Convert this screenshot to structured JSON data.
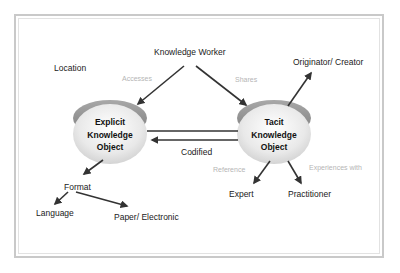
{
  "diagram": {
    "type": "concept-map",
    "nodes": {
      "knowledge_worker": "Knowledge Worker",
      "location": "Location",
      "explicit_object": [
        "Explicit",
        "Knowledge",
        "Object"
      ],
      "tacit_object": [
        "Tacit",
        "Knowledge",
        "Object"
      ],
      "originator": "Originator/ Creator",
      "format": "Format",
      "language": "Language",
      "paper_electronic": "Paper/ Electronic",
      "expert": "Expert",
      "practitioner": "Practitioner"
    },
    "relations": {
      "accesses": "Accesses",
      "shares": "Shares",
      "codified": "Codified",
      "reference": "Reference",
      "experiences_with": "Experiences with"
    },
    "edges": [
      {
        "from": "Knowledge Worker",
        "to": "Explicit Knowledge Object",
        "label": "Accesses"
      },
      {
        "from": "Knowledge Worker",
        "to": "Tacit Knowledge Object",
        "label": "Shares"
      },
      {
        "from": "Tacit Knowledge Object",
        "to": "Originator/ Creator",
        "label": ""
      },
      {
        "from": "Explicit Knowledge Object",
        "to": "Tacit Knowledge Object",
        "label": ""
      },
      {
        "from": "Tacit Knowledge Object",
        "to": "Explicit Knowledge Object",
        "label": "Codified"
      },
      {
        "from": "Explicit Knowledge Object",
        "to": "Format",
        "label": ""
      },
      {
        "from": "Format",
        "to": "Language",
        "label": ""
      },
      {
        "from": "Format",
        "to": "Paper/ Electronic",
        "label": ""
      },
      {
        "from": "Tacit Knowledge Object",
        "to": "Expert",
        "label": "Reference"
      },
      {
        "from": "Tacit Knowledge Object",
        "to": "Practitioner",
        "label": "Experiences with"
      }
    ],
    "colors": {
      "arrow": "#333333",
      "relation_label": "#b5b5b5",
      "frame": "#c9c9c9",
      "disc_top": "#8e8e8e",
      "disc_face": "#e6e6e6"
    }
  }
}
